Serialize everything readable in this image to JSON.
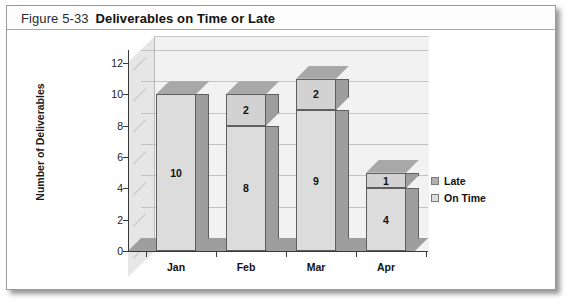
{
  "figure": {
    "number": "Figure 5-33",
    "title": "Deliverables on Time or Late"
  },
  "chart_data": {
    "type": "bar",
    "subtype": "stacked-column-3d",
    "title": "Deliverables on Time or Late",
    "categories": [
      "Jan",
      "Feb",
      "Mar",
      "Apr"
    ],
    "series": [
      {
        "name": "On Time",
        "values": [
          10,
          8,
          9,
          4
        ],
        "color": "#dcdcdc"
      },
      {
        "name": "Late",
        "values": [
          0,
          2,
          2,
          1
        ],
        "color": "#b0b0b0"
      }
    ],
    "xlabel": "",
    "ylabel": "Number of Deliverables",
    "ylim": [
      0,
      12
    ],
    "yticks": [
      0,
      2,
      4,
      6,
      8,
      10,
      12
    ],
    "grid": true,
    "legend_position": "right",
    "data_labels": {
      "Jan": {
        "On Time": "10",
        "Late": ""
      },
      "Feb": {
        "On Time": "8",
        "Late": "2"
      },
      "Mar": {
        "On Time": "9",
        "Late": "2"
      },
      "Apr": {
        "On Time": "4",
        "Late": "1"
      }
    }
  },
  "legend": {
    "items": [
      {
        "label": "Late"
      },
      {
        "label": "On Time"
      }
    ]
  },
  "axis": {
    "y_title": "Number of Deliverables",
    "y_labels": [
      "12",
      "10",
      "8",
      "6",
      "4",
      "2",
      "0"
    ],
    "x_labels": [
      "Jan",
      "Feb",
      "Mar",
      "Apr"
    ]
  }
}
